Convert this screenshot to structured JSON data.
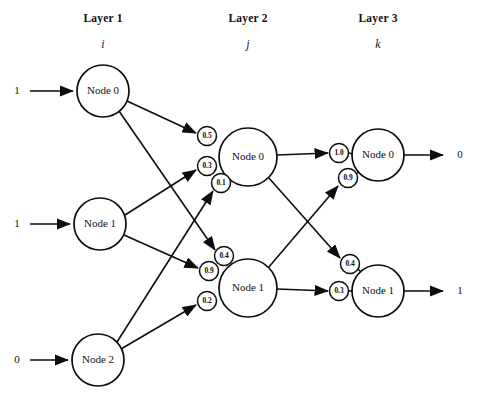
{
  "diagram": {
    "layers": [
      {
        "id": "layer1",
        "title": "Layer 1",
        "subscript": "i",
        "title_x": 103,
        "title_y": 22,
        "sub_x": 103,
        "sub_y": 48
      },
      {
        "id": "layer2",
        "title": "Layer 2",
        "subscript": "j",
        "title_x": 248,
        "title_y": 22,
        "sub_x": 248,
        "sub_y": 48
      },
      {
        "id": "layer3",
        "title": "Layer 3",
        "subscript": "k",
        "title_x": 378,
        "title_y": 22,
        "sub_x": 378,
        "sub_y": 48
      }
    ],
    "nodes": [
      {
        "id": "l1n0",
        "label": "Node 0",
        "layer": "layer1",
        "cx": 103,
        "cy": 91,
        "r": 26
      },
      {
        "id": "l1n1",
        "label": "Node 1",
        "layer": "layer1",
        "cx": 100,
        "cy": 224,
        "r": 26
      },
      {
        "id": "l1n2",
        "label": "Node 2",
        "layer": "layer1",
        "cx": 98,
        "cy": 360,
        "r": 26
      },
      {
        "id": "l2n0",
        "label": "Node 0",
        "layer": "layer2",
        "cx": 248,
        "cy": 157,
        "r": 29
      },
      {
        "id": "l2n1",
        "label": "Node 1",
        "layer": "layer2",
        "cx": 248,
        "cy": 288,
        "r": 29
      },
      {
        "id": "l3n0",
        "label": "Node 0",
        "layer": "layer3",
        "cx": 378,
        "cy": 155,
        "r": 26
      },
      {
        "id": "l3n1",
        "label": "Node 1",
        "layer": "layer3",
        "cx": 378,
        "cy": 291,
        "r": 26
      }
    ],
    "weights": [
      {
        "id": "w-05",
        "value": "0.5",
        "cx": 207,
        "cy": 136,
        "r": 9.5,
        "from": "l1n0",
        "to": "l2n0"
      },
      {
        "id": "w-03",
        "value": "0.3",
        "cx": 207,
        "cy": 166,
        "r": 9.5,
        "from": "l1n1",
        "to": "l2n0"
      },
      {
        "id": "w-01",
        "value": "0.1",
        "cx": 221,
        "cy": 183,
        "r": 9.5,
        "from": "l1n2",
        "to": "l2n0"
      },
      {
        "id": "w-04a",
        "value": "0.4",
        "cx": 224,
        "cy": 256,
        "r": 9.5,
        "from": "l1n0",
        "to": "l2n1"
      },
      {
        "id": "w-09a",
        "value": "0.9",
        "cx": 209,
        "cy": 271,
        "r": 9.5,
        "from": "l1n1",
        "to": "l2n1"
      },
      {
        "id": "w-02",
        "value": "0.2",
        "cx": 207,
        "cy": 301,
        "r": 9.5,
        "from": "l1n2",
        "to": "l2n1"
      },
      {
        "id": "w-10",
        "value": "1.0",
        "cx": 339,
        "cy": 153,
        "r": 9.5,
        "from": "l2n0",
        "to": "l3n0"
      },
      {
        "id": "w-09b",
        "value": "0.9",
        "cx": 348,
        "cy": 178,
        "r": 9.5,
        "from": "l2n1",
        "to": "l3n0"
      },
      {
        "id": "w-04b",
        "value": "0.4",
        "cx": 350,
        "cy": 264,
        "r": 9.5,
        "from": "l2n0",
        "to": "l3n1"
      },
      {
        "id": "w-03b",
        "value": "0.3",
        "cx": 339,
        "cy": 291,
        "r": 9.5,
        "from": "l2n1",
        "to": "l3n1"
      }
    ],
    "inputs": [
      {
        "id": "in0",
        "value": "1",
        "label_x": 17,
        "label_y": 91,
        "line_x1": 30,
        "line_x2": 73,
        "line_y": 91
      },
      {
        "id": "in1",
        "value": "1",
        "label_x": 17,
        "label_y": 224,
        "line_x1": 30,
        "line_x2": 70,
        "line_y": 224
      },
      {
        "id": "in2",
        "value": "0",
        "label_x": 17,
        "label_y": 360,
        "line_x1": 30,
        "line_x2": 68,
        "line_y": 360
      }
    ],
    "outputs": [
      {
        "id": "out0",
        "value": "0",
        "label_x": 460,
        "label_y": 155,
        "line_x1": 404,
        "line_x2": 443,
        "line_y": 155
      },
      {
        "id": "out1",
        "value": "1",
        "label_x": 460,
        "label_y": 291,
        "line_x1": 404,
        "line_x2": 443,
        "line_y": 291
      }
    ],
    "edges": [
      {
        "id": "e-l1n0-w05",
        "x1": 127,
        "y1": 101,
        "x2": 196,
        "y2": 133,
        "arrow": true
      },
      {
        "id": "e-l1n0-w04",
        "x1": 119,
        "y1": 111,
        "x2": 215,
        "y2": 250,
        "arrow": true
      },
      {
        "id": "e-l1n1-w03",
        "x1": 125,
        "y1": 215,
        "x2": 196,
        "y2": 170,
        "arrow": true
      },
      {
        "id": "e-l1n1-w09",
        "x1": 124,
        "y1": 235,
        "x2": 198,
        "y2": 268,
        "arrow": true
      },
      {
        "id": "e-l1n2-w01",
        "x1": 117,
        "y1": 342,
        "x2": 213,
        "y2": 191,
        "arrow": true
      },
      {
        "id": "e-l1n2-w02",
        "x1": 121,
        "y1": 349,
        "x2": 196,
        "y2": 305,
        "arrow": true
      },
      {
        "id": "e-l2n0-w10",
        "x1": 277,
        "y1": 155,
        "x2": 328,
        "y2": 153,
        "arrow": true
      },
      {
        "id": "e-l2n0-w04b",
        "x1": 268,
        "y1": 177,
        "x2": 340,
        "y2": 258,
        "arrow": true
      },
      {
        "id": "e-l2n1-w09b",
        "x1": 268,
        "y1": 268,
        "x2": 338,
        "y2": 186,
        "arrow": true
      },
      {
        "id": "e-l2n1-w03b",
        "x1": 277,
        "y1": 289,
        "x2": 328,
        "y2": 291,
        "arrow": true
      },
      {
        "id": "e-w10-l3n0",
        "x1": 349,
        "y1": 153,
        "x2": 353,
        "y2": 154,
        "arrow": false
      },
      {
        "id": "e-w09b-l3n0",
        "x1": 356,
        "y1": 174,
        "x2": 361,
        "y2": 170,
        "arrow": false
      },
      {
        "id": "e-w04b-l3n1",
        "x1": 357,
        "y1": 268,
        "x2": 362,
        "y2": 273,
        "arrow": false
      },
      {
        "id": "e-w03b-l3n1",
        "x1": 349,
        "y1": 291,
        "x2": 353,
        "y2": 291,
        "arrow": false
      }
    ]
  }
}
